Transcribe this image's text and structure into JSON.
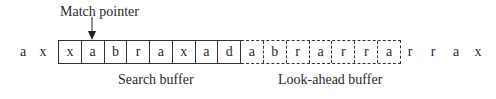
{
  "diagram": {
    "pointer_label": "Match pointer",
    "leading_chars": [
      "a",
      "x"
    ],
    "search_buffer": {
      "label": "Search buffer",
      "cells": [
        "x",
        "a",
        "b",
        "r",
        "a",
        "x",
        "a",
        "d"
      ]
    },
    "lookahead_buffer": {
      "label": "Look-ahead buffer",
      "cells": [
        "a",
        "b",
        "r",
        "a",
        "r",
        "r",
        "a"
      ]
    },
    "trailing_chars": [
      "r",
      "r",
      "a",
      "x"
    ],
    "pointer_target_index": 1
  }
}
